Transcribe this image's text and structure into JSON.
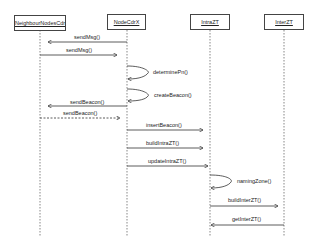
{
  "diagram": {
    "type": "sequence",
    "lifelines": [
      {
        "name": "NeighbourNodesCdr"
      },
      {
        "name": "NodeCdrX"
      },
      {
        "name": "IntraZT"
      },
      {
        "name": "InterZT"
      }
    ],
    "messages": [
      {
        "label": "sendMsg()",
        "from": "NodeCdrX",
        "to": "NeighbourNodesCdr",
        "style": "solid"
      },
      {
        "label": "sendMsg()",
        "from": "NeighbourNodesCdr",
        "to": "NodeCdrX",
        "style": "solid"
      },
      {
        "label": "determinePn()",
        "from": "NodeCdrX",
        "to": "NodeCdrX",
        "style": "self"
      },
      {
        "label": "createBeacon()",
        "from": "NodeCdrX",
        "to": "NodeCdrX",
        "style": "self"
      },
      {
        "label": "sendBeacon()",
        "from": "NodeCdrX",
        "to": "NeighbourNodesCdr",
        "style": "solid"
      },
      {
        "label": "sendBeacon()",
        "from": "NeighbourNodesCdr",
        "to": "NodeCdrX",
        "style": "dashed"
      },
      {
        "label": "insertBeacon()",
        "from": "NodeCdrX",
        "to": "IntraZT",
        "style": "solid"
      },
      {
        "label": "buildIntraZT()",
        "from": "NodeCdrX",
        "to": "IntraZT",
        "style": "solid"
      },
      {
        "label": "updateIntraZT()",
        "from": "NodeCdrX",
        "to": "IntraZT",
        "style": "solid"
      },
      {
        "label": "namingZone()",
        "from": "IntraZT",
        "to": "IntraZT",
        "style": "self"
      },
      {
        "label": "buildInterZT()",
        "from": "IntraZT",
        "to": "InterZT",
        "style": "solid"
      },
      {
        "label": "getInterZT()",
        "from": "InterZT",
        "to": "IntraZT",
        "style": "solid"
      }
    ]
  }
}
